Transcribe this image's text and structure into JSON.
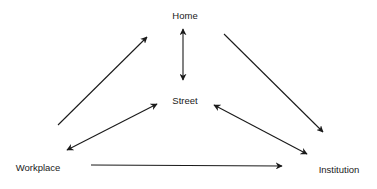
{
  "diagram": {
    "nodes": [
      {
        "id": "home",
        "label": "Home",
        "x": 185,
        "y": 15
      },
      {
        "id": "street",
        "label": "Street",
        "x": 185,
        "y": 100
      },
      {
        "id": "workplace",
        "label": "Workplace",
        "x": 38,
        "y": 167
      },
      {
        "id": "institution",
        "label": "Institution",
        "x": 339,
        "y": 169
      }
    ],
    "edges": [
      {
        "from": "workplace",
        "to": "home",
        "direction": "forward"
      },
      {
        "from": "home",
        "to": "institution",
        "direction": "forward"
      },
      {
        "from": "home",
        "to": "street",
        "direction": "both"
      },
      {
        "from": "street",
        "to": "workplace",
        "direction": "both"
      },
      {
        "from": "street",
        "to": "institution",
        "direction": "both"
      },
      {
        "from": "workplace",
        "to": "institution",
        "direction": "forward"
      }
    ],
    "colors": {
      "line": "#1a1a1a",
      "background": "#ffffff"
    }
  }
}
